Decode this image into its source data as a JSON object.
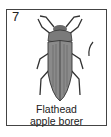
{
  "card": {
    "number": "7",
    "caption_line1": "Flathead",
    "caption_line2": "apple borer",
    "image": "beetle-illustration",
    "scale_mark": "size-scale-mark"
  }
}
